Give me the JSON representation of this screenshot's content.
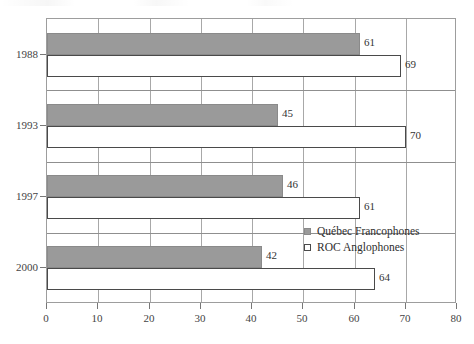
{
  "chart_data": {
    "type": "bar",
    "orientation": "horizontal",
    "title": "",
    "subtitle": "",
    "xlabel": "",
    "ylabel": "",
    "categories": [
      "1988",
      "1993",
      "1997",
      "2000"
    ],
    "xlim": [
      0,
      80
    ],
    "xticks": [
      0,
      10,
      20,
      30,
      40,
      50,
      60,
      70,
      80
    ],
    "xtick_labels": [
      "0",
      "10",
      "20",
      "30",
      "40",
      "50",
      "60",
      "70",
      "80"
    ],
    "grid": true,
    "grid_axis": "x",
    "legend_position": "inside-right-lower",
    "series": [
      {
        "name": "Québec Francophones",
        "style": "filled",
        "color": "#9a9a9a",
        "border_color": "#8a8a8a",
        "values": [
          61,
          45,
          46,
          42
        ],
        "value_labels": [
          "61",
          "45",
          "46",
          "42"
        ]
      },
      {
        "name": "ROC Anglophones",
        "style": "hollow",
        "color": "#ffffff",
        "border_color": "#4a4a4a",
        "values": [
          69,
          70,
          61,
          64
        ],
        "value_labels": [
          "69",
          "70",
          "61",
          "64"
        ]
      }
    ]
  },
  "legend": {
    "items": [
      {
        "label": "Québec Francophones",
        "style": "filled"
      },
      {
        "label": "ROC Anglophones",
        "style": "hollow"
      }
    ]
  },
  "axis": {
    "x_tick_labels": [
      "0",
      "10",
      "20",
      "30",
      "40",
      "50",
      "60",
      "70",
      "80"
    ],
    "y_tick_labels": [
      "1988",
      "1993",
      "1997",
      "2000"
    ]
  },
  "colors": {
    "series_filled": "#9a9a9a",
    "series_hollow": "#ffffff",
    "bar_border_dark": "#4a4a4a",
    "gridline": "#a8a8a8",
    "axis": "#777777",
    "text": "#3a3a3a",
    "background": "#ffffff"
  }
}
